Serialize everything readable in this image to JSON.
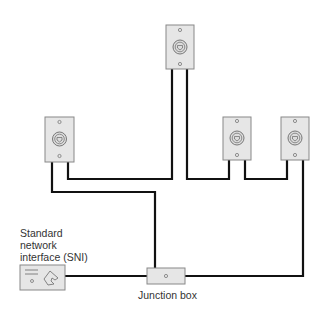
{
  "diagram": {
    "title": "",
    "colors": {
      "wire": "#111111",
      "device_fill": "#e6e6e6",
      "device_stroke": "#888888",
      "text": "#333333"
    },
    "labels": {
      "sni_line1": "Standard",
      "sni_line2": "network",
      "sni_line3": "interface (SNI)",
      "junction_box": "Junction box"
    },
    "nodes": [
      {
        "id": "jack-top",
        "type": "wall-jack"
      },
      {
        "id": "jack-left",
        "type": "wall-jack"
      },
      {
        "id": "jack-right-1",
        "type": "wall-jack"
      },
      {
        "id": "jack-right-2",
        "type": "wall-jack"
      },
      {
        "id": "junction-box",
        "type": "junction-box",
        "label": "Junction box"
      },
      {
        "id": "sni",
        "type": "standard-network-interface",
        "label": "Standard network interface (SNI)"
      }
    ],
    "edges": [
      {
        "from": "sni",
        "to": "junction-box"
      },
      {
        "from": "junction-box",
        "to": "jack-left"
      },
      {
        "from": "jack-left",
        "to": "jack-top"
      },
      {
        "from": "jack-top",
        "to": "jack-right-1"
      },
      {
        "from": "jack-right-1",
        "to": "jack-right-2"
      },
      {
        "from": "jack-right-2",
        "to": "junction-box"
      }
    ]
  }
}
